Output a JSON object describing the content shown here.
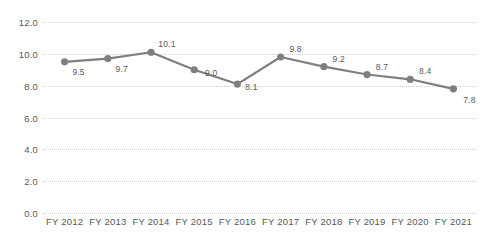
{
  "chart_data": {
    "type": "line",
    "title": "",
    "xlabel": "",
    "ylabel": "",
    "categories": [
      "FY 2012",
      "FY 2013",
      "FY 2014",
      "FY 2015",
      "FY 2016",
      "FY 2017",
      "FY 2018",
      "FY 2019",
      "FY 2020",
      "FY 2021"
    ],
    "values": [
      9.5,
      9.7,
      10.1,
      9.0,
      8.1,
      9.8,
      9.2,
      8.7,
      8.4,
      7.8
    ],
    "point_labels": [
      "9.5",
      "9.7",
      "10.1",
      "9.0",
      "8.1",
      "9.8",
      "9.2",
      "8.7",
      "8.4",
      "7.8"
    ],
    "ylim": [
      0.0,
      12.0
    ],
    "ytick_values": [
      12.0,
      10.0,
      8.0,
      6.0,
      4.0,
      2.0,
      0.0
    ],
    "ytick_labels": [
      "12.0",
      "10.0",
      "8.0",
      "6.0",
      "4.0",
      "2.0",
      "0.0"
    ],
    "grid": true,
    "legend": false,
    "series_color": "#7f7f7f",
    "grid_color": "#cfcfcf",
    "text_color": "#595959",
    "label_offsets": [
      {
        "dx": 14,
        "dy": 10
      },
      {
        "dx": 14,
        "dy": 10
      },
      {
        "dx": 16,
        "dy": -8
      },
      {
        "dx": 17,
        "dy": 3
      },
      {
        "dx": 14,
        "dy": 3
      },
      {
        "dx": 15,
        "dy": -8
      },
      {
        "dx": 15,
        "dy": -8
      },
      {
        "dx": 15,
        "dy": -8
      },
      {
        "dx": 15,
        "dy": -8
      },
      {
        "dx": 16,
        "dy": 11
      }
    ]
  }
}
